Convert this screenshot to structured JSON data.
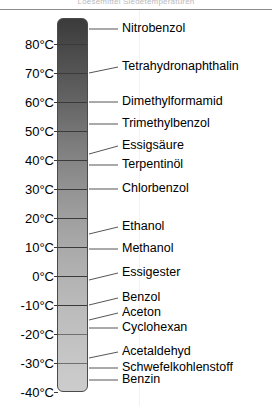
{
  "caption": {
    "clipped_text": "Loesemittel Siedetemperaturen"
  },
  "axis": {
    "unit": "°C",
    "ticks": [
      {
        "label": "80°C",
        "value": 80,
        "y": 44
      },
      {
        "label": "70°C",
        "value": 70,
        "y": 73
      },
      {
        "label": "60°C",
        "value": 60,
        "y": 102
      },
      {
        "label": "50°C",
        "value": 50,
        "y": 131
      },
      {
        "label": "40°C",
        "value": 40,
        "y": 160
      },
      {
        "label": "30°C",
        "value": 30,
        "y": 189
      },
      {
        "label": "20°C",
        "value": 20,
        "y": 218
      },
      {
        "label": "10°C",
        "value": 10,
        "y": 247
      },
      {
        "label": "0°C",
        "value": 0,
        "y": 276
      },
      {
        "label": "-10°C",
        "value": -10,
        "y": 305
      },
      {
        "label": "-20°C",
        "value": -20,
        "y": 334
      },
      {
        "label": "-30°C",
        "value": -30,
        "y": 363
      },
      {
        "label": "-40°C",
        "value": -40,
        "y": 392
      }
    ]
  },
  "thermometer": {
    "top_color": "#3b3b3b",
    "bottom_color": "#cccccc",
    "border_color": "#4b4b4b"
  },
  "substances": [
    {
      "name": "Nitrobenzol",
      "label_y": 29,
      "tick_y": 29,
      "slanted": false
    },
    {
      "name": "Tetrahydronaphthalin",
      "label_y": 67,
      "tick_y": 73,
      "slanted": false
    },
    {
      "name": "Dimethylformamid",
      "label_y": 102,
      "tick_y": 102,
      "slanted": false
    },
    {
      "name": "Trimethylbenzol",
      "label_y": 124,
      "tick_y": 124,
      "slanted": false
    },
    {
      "name": "Essigsäure",
      "label_y": 146,
      "tick_y": 154,
      "slanted": true
    },
    {
      "name": "Terpentinöl",
      "label_y": 165,
      "tick_y": 165,
      "slanted": false
    },
    {
      "name": "Chlorbenzol",
      "label_y": 189,
      "tick_y": 189,
      "slanted": false
    },
    {
      "name": "Ethanol",
      "label_y": 227,
      "tick_y": 234,
      "slanted": true
    },
    {
      "name": "Methanol",
      "label_y": 249,
      "tick_y": 249,
      "slanted": false
    },
    {
      "name": "Essigester",
      "label_y": 273,
      "tick_y": 280,
      "slanted": true
    },
    {
      "name": "Benzol",
      "label_y": 298,
      "tick_y": 305,
      "slanted": true
    },
    {
      "name": "Aceton",
      "label_y": 313,
      "tick_y": 320,
      "slanted": true
    },
    {
      "name": "Cyclohexan",
      "label_y": 328,
      "tick_y": 328,
      "slanted": false
    },
    {
      "name": "Acetaldehyd",
      "label_y": 352,
      "tick_y": 358,
      "slanted": true
    },
    {
      "name": "Schwefelkohlenstoff",
      "label_y": 368,
      "tick_y": 368,
      "slanted": false
    },
    {
      "name": "Benzin",
      "label_y": 380,
      "tick_y": 380,
      "slanted": false
    }
  ],
  "chart_data": {
    "type": "bar",
    "title": "",
    "xlabel": "",
    "ylabel": "Temperatur",
    "ylim": [
      -45,
      90
    ],
    "grid": true,
    "legend": "none",
    "orientation": "vertical",
    "axis_unit": "°C",
    "tick_labels": [
      "80°C",
      "70°C",
      "60°C",
      "50°C",
      "40°C",
      "30°C",
      "20°C",
      "10°C",
      "0°C",
      "-10°C",
      "-20°C",
      "-30°C",
      "-40°C"
    ],
    "tick_values": [
      80,
      70,
      60,
      50,
      40,
      30,
      20,
      10,
      0,
      -10,
      -20,
      -30,
      -40
    ],
    "categories": [
      "Nitrobenzol",
      "Tetrahydronaphthalin",
      "Dimethylformamid",
      "Trimethylbenzol",
      "Essigsäure",
      "Terpentinöl",
      "Chlorbenzol",
      "Ethanol",
      "Methanol",
      "Essigester",
      "Benzol",
      "Aceton",
      "Cyclohexan",
      "Acetaldehyd",
      "Schwefelkohlenstoff",
      "Benzin"
    ],
    "values": [
      85,
      70,
      60,
      55,
      45,
      42,
      30,
      15,
      10,
      2,
      -10,
      -15,
      -18,
      -28,
      -32,
      -36
    ],
    "annotations": [
      "Skala von 80 °C bis -40 °C in 10-°C-Schritten",
      "Farbverlauf dunkel (warm, oben) nach hell (kalt, unten)"
    ]
  }
}
